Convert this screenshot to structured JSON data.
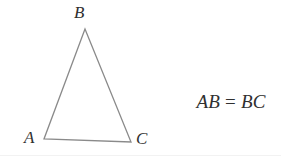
{
  "figure": {
    "type": "geometry-diagram",
    "width": 281,
    "height": 158,
    "background_color": "#ffffff",
    "stroke_color": "#8a8a8a",
    "text_color": "#303030"
  },
  "triangle": {
    "name": "isosceles-triangle-ABC",
    "vertices": [
      {
        "label": "A",
        "x": 44,
        "y": 139
      },
      {
        "label": "B",
        "x": 85,
        "y": 29
      },
      {
        "label": "C",
        "x": 131,
        "y": 142
      }
    ],
    "path": "M 85 29 L 44 139 L 131 142 Z"
  },
  "labels": {
    "apex": "B",
    "bottom_left": "A",
    "bottom_right": "C"
  },
  "equation": {
    "left_side": "AB",
    "relation": "=",
    "right_side": "BC",
    "full_text": "AB = BC"
  },
  "rule": {
    "color": "#f2f2f2"
  }
}
